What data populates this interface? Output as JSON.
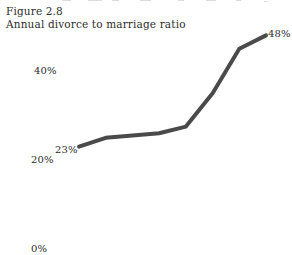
{
  "figure": {
    "number_line": "Figure 2.8",
    "caption_line": "Annual divorce to marriage ratio"
  },
  "chart_data": {
    "type": "line",
    "title": "Annual divorce to marriage ratio",
    "subtitle": "Figure 2.8",
    "xlabel": "",
    "ylabel": "",
    "ylim": [
      0,
      50
    ],
    "ytick_labels": [
      "0%",
      "20%",
      "40%"
    ],
    "ytick_values": [
      0,
      20,
      40
    ],
    "grid": false,
    "legend": false,
    "axis_lines": false,
    "line_color": "#4a4a4a",
    "line_width_px": 4,
    "annotations": [
      {
        "name": "start-value",
        "text": "23%",
        "value": 23,
        "position": "start"
      },
      {
        "name": "end-value",
        "text": "48%",
        "value": 48,
        "position": "end"
      }
    ],
    "x": [
      0,
      1,
      2,
      3,
      4,
      5,
      6,
      7
    ],
    "values": [
      23,
      25,
      25.5,
      26,
      27.5,
      35,
      45,
      48
    ],
    "series": [
      {
        "name": "Annual divorce to marriage ratio",
        "values": [
          23,
          25,
          25.5,
          26,
          27.5,
          35,
          45,
          48
        ]
      }
    ]
  },
  "labels": {
    "y_40": "40%",
    "y_20": "20%",
    "y_0": "0%",
    "data_start": "23%",
    "data_end": "48%"
  }
}
